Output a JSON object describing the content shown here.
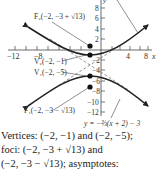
{
  "figure": {
    "axes": {
      "x_label": "x",
      "y_label": "y",
      "x_ticks": [
        "−12",
        "−8",
        "4",
        "8"
      ],
      "y_ticks": [
        "8",
        "6",
        "4",
        "2",
        "2",
        "4",
        "6",
        "8",
        "10",
        "12"
      ],
      "y_ticks_values": [
        8,
        6,
        4,
        2,
        -2,
        -4,
        -6,
        -8,
        -10,
        -12
      ]
    },
    "labels": {
      "f2": "F₂(−2, −3 + √13)",
      "v2": "V₂(−2, −1)",
      "v1": "V₁(−2, −5)",
      "f1": "F₁(−2, −3 − √13)",
      "asymptote": "y = −⅔(x + 2) − 3"
    },
    "points": [
      {
        "name": "F2",
        "x": -2,
        "y": 0.606
      },
      {
        "name": "V2",
        "x": -2,
        "y": -1
      },
      {
        "name": "V1",
        "x": -2,
        "y": -5
      },
      {
        "name": "F1",
        "x": -2,
        "y": -6.606
      }
    ]
  },
  "caption": {
    "line1": "Vertices: (−2, −1) and (−2, −5);",
    "line2": "foci: (−2, −3 + √13) and",
    "line3": "(−2, −3 − √13); asymptotes:"
  }
}
